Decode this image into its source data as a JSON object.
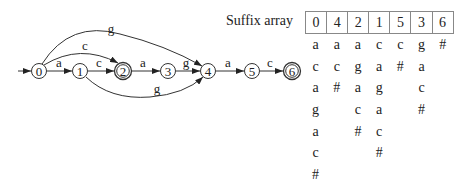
{
  "automaton": {
    "states": [
      {
        "id": "0",
        "x": 39,
        "final": false,
        "initial": true
      },
      {
        "id": "1",
        "x": 80,
        "final": false
      },
      {
        "id": "2",
        "x": 123,
        "final": true
      },
      {
        "id": "3",
        "x": 168,
        "final": false
      },
      {
        "id": "4",
        "x": 208,
        "final": false
      },
      {
        "id": "5",
        "x": 252,
        "final": false
      },
      {
        "id": "6",
        "x": 292,
        "final": true
      }
    ],
    "transitions": [
      {
        "from": "0",
        "to": "1",
        "label": "a"
      },
      {
        "from": "1",
        "to": "2",
        "label": "c"
      },
      {
        "from": "2",
        "to": "3",
        "label": "a"
      },
      {
        "from": "3",
        "to": "4",
        "label": "g"
      },
      {
        "from": "4",
        "to": "5",
        "label": "a"
      },
      {
        "from": "5",
        "to": "6",
        "label": "c"
      },
      {
        "from": "0",
        "to": "2",
        "label": "c"
      },
      {
        "from": "0",
        "to": "4",
        "label": "g"
      },
      {
        "from": "1",
        "to": "4",
        "label": "g"
      }
    ]
  },
  "suffix_array": {
    "title": "Suffix array",
    "indices": [
      "0",
      "4",
      "2",
      "1",
      "5",
      "3",
      "6"
    ],
    "suffixes": [
      [
        "a",
        "c",
        "a",
        "g",
        "a",
        "c",
        "#"
      ],
      [
        "a",
        "c",
        "#"
      ],
      [
        "a",
        "g",
        "a",
        "c",
        "#"
      ],
      [
        "c",
        "a",
        "g",
        "a",
        "c",
        "#"
      ],
      [
        "c",
        "#"
      ],
      [
        "g",
        "a",
        "c",
        "#"
      ],
      [
        "#"
      ]
    ]
  }
}
